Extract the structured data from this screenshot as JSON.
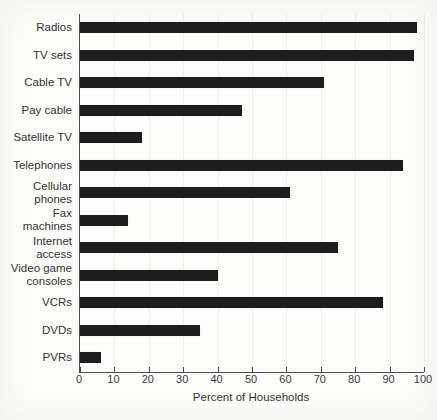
{
  "chart_data": {
    "type": "bar",
    "orientation": "horizontal",
    "title": "",
    "xlabel": "Percent of Households",
    "ylabel": "",
    "xlim": [
      0,
      100
    ],
    "xticks": [
      0,
      10,
      20,
      30,
      40,
      50,
      60,
      70,
      80,
      90,
      100
    ],
    "grid": "faint vertical gridlines at each tick",
    "legend": "none",
    "bar_color": "#1d1d1d",
    "categories": [
      "Radios",
      "TV sets",
      "Cable TV",
      "Pay cable",
      "Satellite TV",
      "Telephones",
      "Cellular\nphones",
      "Fax\nmachines",
      "Internet\naccess",
      "Video game\nconsoles",
      "VCRs",
      "DVDs",
      "PVRs"
    ],
    "values": [
      98,
      97,
      71,
      47,
      18,
      94,
      61,
      14,
      75,
      40,
      88,
      35,
      6
    ]
  }
}
